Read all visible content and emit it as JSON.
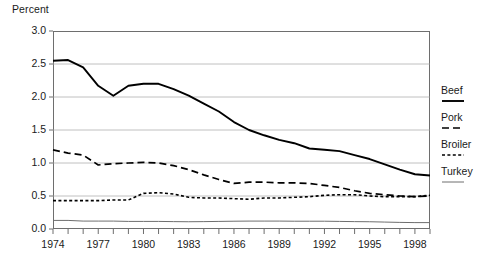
{
  "chart_data": {
    "type": "line",
    "title": "",
    "xlabel": "",
    "ylabel": "Percent",
    "ylim": [
      0.0,
      3.0
    ],
    "xlim": [
      1974,
      1999
    ],
    "grid": true,
    "legend_position": "right",
    "ytick_labels": [
      "3.0",
      "2.5",
      "2.0",
      "1.5",
      "1.0",
      "0.5",
      "0.0"
    ],
    "ytick_values": [
      3.0,
      2.5,
      2.0,
      1.5,
      1.0,
      0.5,
      0.0
    ],
    "xtick_labels": [
      "1974",
      "1977",
      "1980",
      "1983",
      "1986",
      "1989",
      "1992",
      "1995",
      "1998"
    ],
    "xtick_values": [
      1974,
      1977,
      1980,
      1983,
      1986,
      1989,
      1992,
      1995,
      1998
    ],
    "x": [
      1974,
      1975,
      1976,
      1977,
      1978,
      1979,
      1980,
      1981,
      1982,
      1983,
      1984,
      1985,
      1986,
      1987,
      1988,
      1989,
      1990,
      1991,
      1992,
      1993,
      1994,
      1995,
      1996,
      1997,
      1998,
      1999
    ],
    "series": [
      {
        "name": "Beef",
        "style": "solid",
        "color": "#000000",
        "width": 1.9,
        "values": [
          2.55,
          2.56,
          2.45,
          2.17,
          2.02,
          2.17,
          2.2,
          2.2,
          2.12,
          2.02,
          1.9,
          1.78,
          1.62,
          1.5,
          1.42,
          1.35,
          1.3,
          1.22,
          1.2,
          1.18,
          1.12,
          1.06,
          0.98,
          0.9,
          0.83,
          0.81
        ]
      },
      {
        "name": "Pork",
        "style": "dashed",
        "color": "#000000",
        "width": 1.7,
        "values": [
          1.2,
          1.15,
          1.12,
          0.97,
          0.99,
          1.0,
          1.01,
          1.0,
          0.96,
          0.9,
          0.82,
          0.75,
          0.69,
          0.71,
          0.71,
          0.7,
          0.7,
          0.69,
          0.66,
          0.63,
          0.58,
          0.54,
          0.52,
          0.5,
          0.49,
          0.5
        ]
      },
      {
        "name": "Broiler",
        "style": "dotted",
        "color": "#000000",
        "width": 1.6,
        "values": [
          0.43,
          0.43,
          0.43,
          0.43,
          0.44,
          0.44,
          0.54,
          0.55,
          0.53,
          0.48,
          0.47,
          0.47,
          0.46,
          0.45,
          0.47,
          0.47,
          0.48,
          0.49,
          0.51,
          0.52,
          0.52,
          0.5,
          0.49,
          0.49,
          0.49,
          0.51
        ]
      },
      {
        "name": "Turkey",
        "style": "solid-thin",
        "color": "#6e6e6e",
        "width": 1.0,
        "values": [
          0.13,
          0.13,
          0.12,
          0.12,
          0.12,
          0.115,
          0.115,
          0.115,
          0.112,
          0.11,
          0.112,
          0.115,
          0.118,
          0.12,
          0.12,
          0.12,
          0.118,
          0.118,
          0.118,
          0.115,
          0.112,
          0.11,
          0.105,
          0.1,
          0.097,
          0.097
        ]
      }
    ]
  },
  "legend": {
    "entries": [
      {
        "label": "Beef"
      },
      {
        "label": "Pork"
      },
      {
        "label": "Broiler"
      },
      {
        "label": "Turkey"
      }
    ]
  }
}
